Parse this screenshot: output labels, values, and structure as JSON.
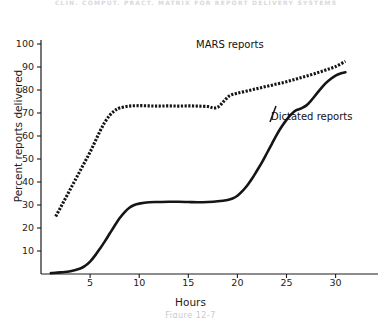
{
  "figure": {
    "running_head": "CLIN. COMPUT. PRACT. MATRIX FOR REPORT DELIVERY SYSTEMS",
    "caption": "Figure 12-7"
  },
  "chart_data": {
    "type": "line",
    "title": "",
    "xlabel": "Hours",
    "ylabel": "Percent reports delivered",
    "xlim": [
      0,
      34
    ],
    "ylim": [
      0,
      100
    ],
    "xticks": [
      5,
      10,
      15,
      20,
      25,
      30
    ],
    "yticks": [
      10,
      20,
      30,
      40,
      50,
      60,
      70,
      80,
      90,
      100
    ],
    "grid": false,
    "legend_position": "inline-annotation",
    "series": [
      {
        "name": "MARS reports",
        "style": "dotted",
        "color": "#151515",
        "label_x": 20.5,
        "label_y": 87,
        "x": [
          1.5,
          2,
          2.5,
          3,
          3.5,
          4,
          4.5,
          5,
          5.5,
          6,
          6.5,
          7,
          7.5,
          8,
          9,
          10,
          11,
          12,
          13,
          14,
          15,
          16,
          17,
          17.6,
          18.1,
          18.6,
          19.2,
          20,
          21,
          22,
          23,
          24,
          25,
          26,
          27,
          28,
          29,
          30,
          31
        ],
        "y": [
          25,
          29,
          33,
          37,
          41,
          45,
          49,
          53,
          57.5,
          62,
          66,
          69,
          71,
          72.2,
          73,
          73.2,
          73.1,
          73,
          73.1,
          73,
          73.1,
          73,
          72.8,
          72.2,
          72.8,
          75,
          77.5,
          78.6,
          79.6,
          80.6,
          81.6,
          82.6,
          83.6,
          84.8,
          86,
          87.3,
          88.7,
          90.2,
          92.5
        ]
      },
      {
        "name": "Dictated reports",
        "style": "solid",
        "color": "#151515",
        "label_x": 25.5,
        "label_y": 57,
        "x": [
          1,
          2,
          3,
          4,
          4.5,
          5,
          5.5,
          6,
          6.5,
          7,
          7.5,
          8,
          8.5,
          9,
          9.5,
          10,
          11,
          12,
          13,
          14,
          15,
          16,
          17,
          18,
          19,
          19.5,
          20,
          20.5,
          21,
          21.5,
          22,
          22.5,
          23,
          23.5,
          24,
          24.5,
          25,
          25.5,
          26,
          26.5,
          27,
          27.5,
          28,
          28.5,
          29,
          29.5,
          30,
          30.5,
          31
        ],
        "y": [
          0.4,
          0.7,
          1.2,
          2.4,
          3.6,
          5.4,
          8,
          11,
          14.2,
          17.6,
          21,
          24.2,
          26.8,
          28.8,
          30,
          30.6,
          31.2,
          31.3,
          31.4,
          31.4,
          31.3,
          31.2,
          31.3,
          31.6,
          32.2,
          32.8,
          34,
          36,
          38.5,
          41.5,
          45,
          48.5,
          52.5,
          56.5,
          60.5,
          64,
          67,
          69.5,
          71.2,
          72,
          73.2,
          75.4,
          78,
          80.6,
          83,
          84.8,
          86.3,
          87.2,
          87.7
        ]
      }
    ]
  }
}
